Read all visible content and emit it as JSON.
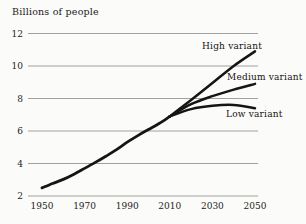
{
  "title": "Billions of people",
  "colors": {
    "background": "#fbfbf9",
    "line": "#151515",
    "gridline": "#a0a0a0",
    "text": "#1c1c1c"
  },
  "chart_data": {
    "type": "line",
    "title": "Billions of people",
    "xlabel": "",
    "ylabel": "Billions of people",
    "xlim": [
      1950,
      2050
    ],
    "ylim": [
      2,
      12
    ],
    "grid": "horizontal",
    "x_ticks": [
      "1950",
      "1970",
      "1990",
      "2010",
      "2030",
      "2050"
    ],
    "x_tick_years": [
      1950,
      1970,
      1990,
      2010,
      2030,
      2050
    ],
    "y_ticks": [
      "2",
      "4",
      "6",
      "8",
      "10",
      "12"
    ],
    "y_tick_values": [
      2,
      4,
      6,
      8,
      10,
      12
    ],
    "legend_position": "inline-annotations",
    "series": [
      {
        "name": "estimated-population",
        "label": "",
        "x": [
          1950,
          1955,
          1960,
          1965,
          1970,
          1975,
          1980,
          1985,
          1990,
          1995,
          2000,
          2005,
          2010
        ],
        "values": [
          2.5,
          2.77,
          3.02,
          3.34,
          3.7,
          4.07,
          4.45,
          4.85,
          5.31,
          5.72,
          6.09,
          6.46,
          6.9
        ]
      },
      {
        "name": "high-variant",
        "label": "High variant",
        "x": [
          2010,
          2020,
          2030,
          2040,
          2050
        ],
        "values": [
          6.9,
          7.9,
          8.95,
          10.0,
          10.9
        ]
      },
      {
        "name": "medium-variant",
        "label": "Medium variant",
        "x": [
          2010,
          2020,
          2030,
          2040,
          2050
        ],
        "values": [
          6.9,
          7.65,
          8.15,
          8.55,
          8.9
        ]
      },
      {
        "name": "low-variant",
        "label": "Low variant",
        "x": [
          2010,
          2020,
          2030,
          2040,
          2050
        ],
        "values": [
          6.9,
          7.35,
          7.55,
          7.6,
          7.4
        ]
      }
    ]
  }
}
